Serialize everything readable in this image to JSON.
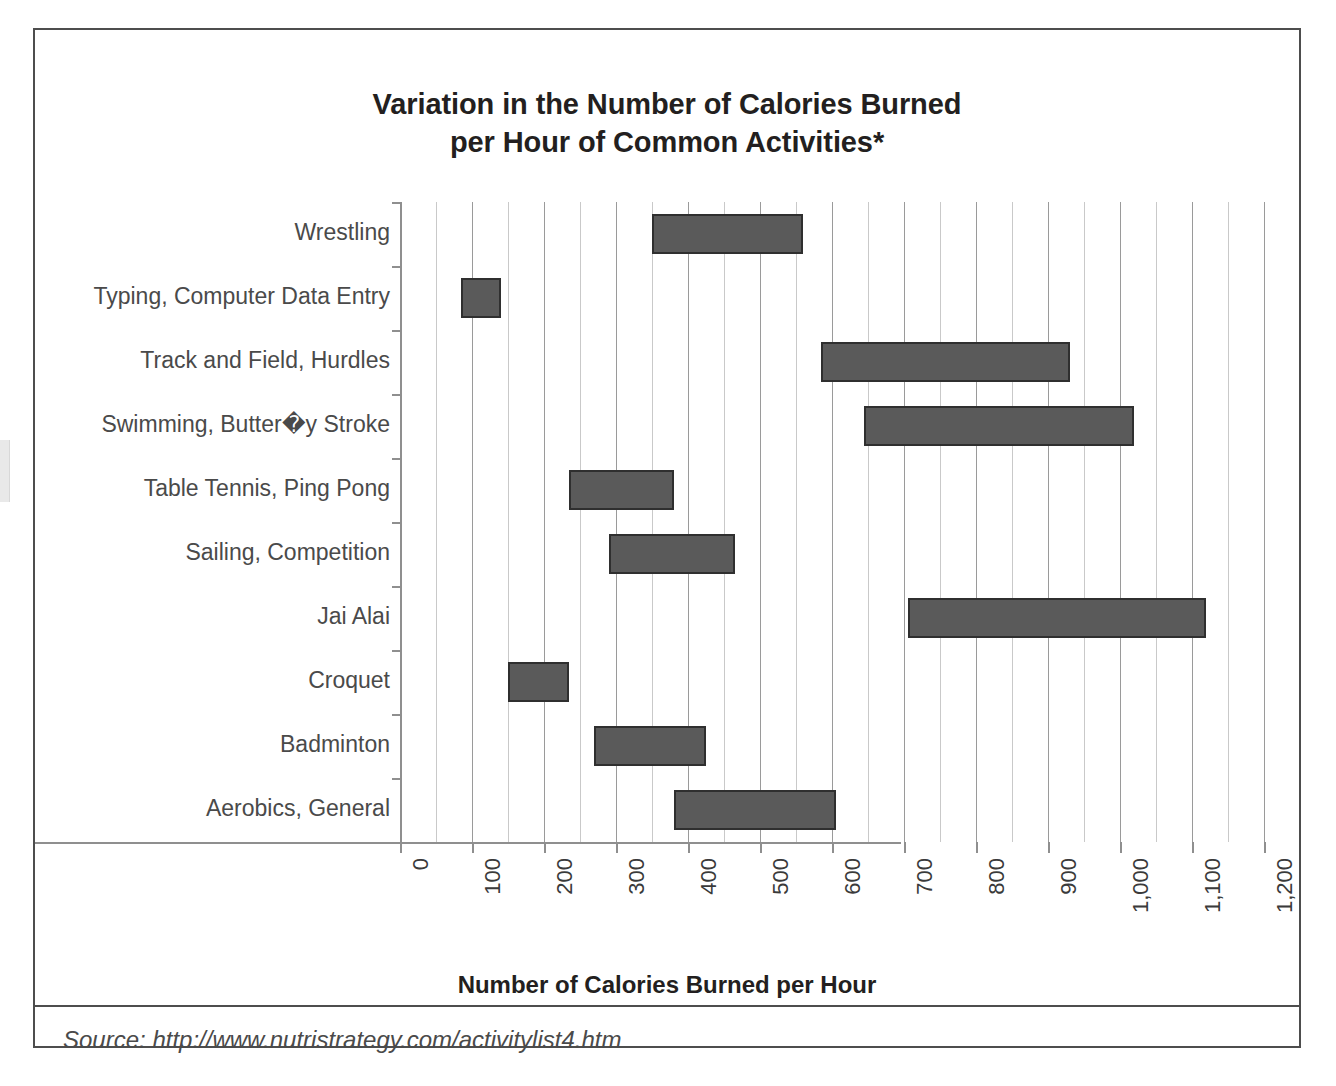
{
  "figure": {
    "title_line1": "Variation in the Number of Calories Burned",
    "title_line2": "per Hour of Common Activities*",
    "source": "Source: http://www.nutristrategy.com/activitylist4.htm",
    "colors": {
      "bar_fill": "#5a5a5a",
      "bar_stroke": "#2f2f2f",
      "gridline_major": "#9a9a9a",
      "gridline_minor": "#c9c9c9",
      "axis": "#8f8f8f",
      "title_text": "#231f20",
      "label_text": "#4a4a4a",
      "frame": "#4d4d4d"
    }
  },
  "chart_data": {
    "type": "bar",
    "orientation": "horizontal",
    "subtype": "floating-range-bar",
    "title": "Variation in the Number of Calories Burned per Hour of Common Activities*",
    "xlabel": "Number of Calories Burned per Hour",
    "ylabel": "",
    "xlim": [
      0,
      1200
    ],
    "xticks": [
      0,
      100,
      200,
      300,
      400,
      500,
      600,
      700,
      800,
      900,
      1000,
      1100,
      1200
    ],
    "xticklabels": [
      "0",
      "100",
      "200",
      "300",
      "400",
      "500",
      "600",
      "700",
      "800",
      "900",
      "1,000",
      "1,100",
      "1,200"
    ],
    "xtick_label_rotation": 90,
    "minor_gridline_interval": 50,
    "grid": "vertical",
    "legend": "none",
    "categories": [
      "Wrestling",
      "Typing, Computer Data Entry",
      "Track and Field, Hurdles",
      "Swimming, Butter�y Stroke",
      "Table Tennis, Ping Pong",
      "Sailing, Competition",
      "Jai Alai",
      "Croquet",
      "Badminton",
      "Aerobics, General"
    ],
    "ranges": [
      {
        "label": "Wrestling",
        "low": 350,
        "high": 560
      },
      {
        "label": "Typing, Computer Data Entry",
        "low": 85,
        "high": 140
      },
      {
        "label": "Track and Field, Hurdles",
        "low": 585,
        "high": 930
      },
      {
        "label": "Swimming, Butter�y Stroke",
        "low": 645,
        "high": 1020
      },
      {
        "label": "Table Tennis, Ping Pong",
        "low": 235,
        "high": 380
      },
      {
        "label": "Sailing, Competition",
        "low": 290,
        "high": 465
      },
      {
        "label": "Jai Alai",
        "low": 705,
        "high": 1120
      },
      {
        "label": "Croquet",
        "low": 150,
        "high": 235
      },
      {
        "label": "Badminton",
        "low": 270,
        "high": 425
      },
      {
        "label": "Aerobics, General",
        "low": 380,
        "high": 605
      }
    ]
  }
}
